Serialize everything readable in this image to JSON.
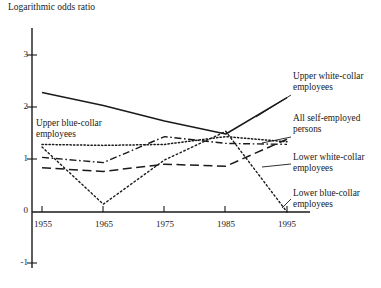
{
  "chart_data": {
    "type": "line",
    "title": "Logarithmic odds ratio",
    "xlabel": "",
    "ylabel": "Logarithmic odds ratio",
    "x": [
      1955,
      1965,
      1975,
      1985,
      1995
    ],
    "xtick_labels": [
      "1955",
      "1965",
      "1975",
      "1985",
      "1995"
    ],
    "ytick_labels": [
      "3",
      "2",
      "1",
      "0",
      "-1"
    ],
    "ytick_values": [
      3,
      2,
      1,
      0,
      -1
    ],
    "ylim": [
      -1,
      3.3
    ],
    "xlim": [
      1953,
      1998
    ],
    "grid": false,
    "legend_position": "inline-annotations",
    "axis_color": "#1a1a1a",
    "series": [
      {
        "name": "Upper white-collar employees",
        "style": "solid",
        "label_side": "right",
        "values": [
          2.3,
          2.05,
          1.75,
          1.5,
          2.2
        ]
      },
      {
        "name": "Upper blue-collar employees",
        "style": "dotted",
        "label_side": "left",
        "values": [
          1.3,
          1.28,
          1.3,
          1.45,
          1.35
        ]
      },
      {
        "name": "All self-employed persons",
        "style": "dash-dot",
        "label_side": "right",
        "values": [
          1.05,
          0.95,
          1.45,
          1.32,
          1.3
        ]
      },
      {
        "name": "Lower white-collar employees",
        "style": "long-dash",
        "label_side": "right",
        "values": [
          0.85,
          0.78,
          0.92,
          0.88,
          1.4
        ]
      },
      {
        "name": "Lower blue-collar employees",
        "style": "fine-dotted",
        "label_side": "right",
        "values": [
          1.25,
          0.15,
          1.0,
          1.55,
          0.0
        ]
      }
    ],
    "annotations": [
      {
        "text_line1": "Upper blue-collar",
        "text_line2": "employees"
      },
      {
        "text_line1": "Upper white-collar",
        "text_line2": "employees"
      },
      {
        "text_line1": "All self-employed",
        "text_line2": "persons"
      },
      {
        "text_line1": "Lower white-collar",
        "text_line2": "employees"
      },
      {
        "text_line1": "Lower blue-collar",
        "text_line2": "employees"
      }
    ]
  }
}
